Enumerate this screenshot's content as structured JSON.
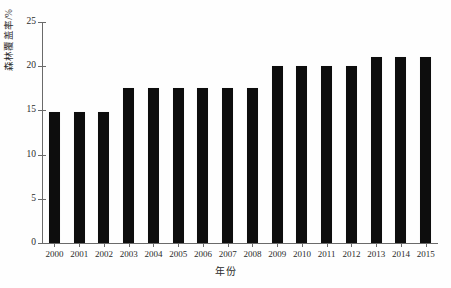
{
  "chart_data": {
    "type": "bar",
    "title": "",
    "xlabel": "年份",
    "ylabel": "森林覆盖率/%",
    "categories": [
      "2000",
      "2001",
      "2002",
      "2003",
      "2004",
      "2005",
      "2006",
      "2007",
      "2008",
      "2009",
      "2010",
      "2011",
      "2012",
      "2013",
      "2014",
      "2015"
    ],
    "values": [
      14.8,
      14.8,
      14.8,
      17.5,
      17.5,
      17.5,
      17.5,
      17.5,
      17.5,
      20.0,
      20.0,
      20.0,
      20.0,
      21.0,
      21.0,
      21.0
    ],
    "series": [
      {
        "name": "森林覆盖率",
        "values": [
          14.8,
          14.8,
          14.8,
          17.5,
          17.5,
          17.5,
          17.5,
          17.5,
          17.5,
          20.0,
          20.0,
          20.0,
          20.0,
          21.0,
          21.0,
          21.0
        ]
      }
    ],
    "ylim": [
      0,
      25
    ],
    "yticks": [
      0,
      5,
      10,
      15,
      20,
      25
    ],
    "ytick_labels": [
      "0",
      "5",
      "10",
      "15",
      "20",
      "25"
    ],
    "xtick_labels": [
      "2000",
      "2001",
      "2002",
      "2003",
      "2004",
      "2005",
      "2006",
      "2007",
      "2008",
      "2009",
      "2010",
      "2011",
      "2012",
      "2013",
      "2014",
      "2015"
    ],
    "grid": false,
    "legend": null,
    "legend_position": "none",
    "bar_color": "#0d0d0d",
    "axis_color": "#6a6a6a",
    "background_color": "#ffffff",
    "annotations": []
  }
}
